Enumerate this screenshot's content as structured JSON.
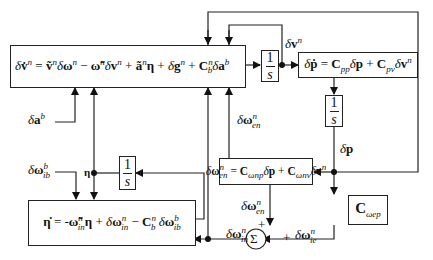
{
  "diagram": {
    "type": "block-diagram",
    "blocks": {
      "velocity_error": {
        "lhs": "δv̇ⁿ",
        "rhs": "= ṽⁿδωⁿ − ω̃ⁿδvⁿ + ãⁿη + δgⁿ + Cₙᵇδaᵇ"
      },
      "position_error": {
        "text": "δṗ = C_pp δp + C_pv δvⁿ"
      },
      "attitude_error": {
        "text": "η̇ = -ω̃ⁿ_in η + δωⁿ_in − Cⁿ_b δωᵇ_ib"
      },
      "transport_rate": {
        "text": "δωⁿ_en = C_ωnp δp + C_ωnv δvⁿ"
      },
      "earth_rate": {
        "text": "C_ωep"
      },
      "integrator_label": {
        "num": "1",
        "den": "s"
      },
      "sum_label": "Σ"
    },
    "signals": {
      "dv": "δvⁿ",
      "dp": "δp",
      "eta": "η",
      "dab": "δaᵇ",
      "dwib": "δωᵇ_ib",
      "dwen_top": "δωⁿ_en",
      "dwen_bottom": "δωⁿ_en",
      "dwin": "δωⁿ_in",
      "dwie": "δωⁿ_ie",
      "plus1": "+",
      "plus2": "+"
    }
  }
}
